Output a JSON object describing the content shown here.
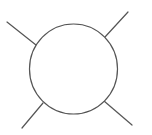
{
  "diagram": {
    "width": 152,
    "height": 135,
    "background": "#ffffff",
    "stroke_color": "#555555",
    "stroke_width": 1.2,
    "circle": {
      "cx": 73.5,
      "cy": 69,
      "rx": 44,
      "ry": 45,
      "fill": "#ffffff"
    },
    "lines": [
      {
        "name": "top-left-line",
        "x1": 7,
        "y1": 22,
        "x2": 36,
        "y2": 45
      },
      {
        "name": "top-right-line",
        "x1": 105,
        "y1": 37,
        "x2": 128,
        "y2": 12
      },
      {
        "name": "bottom-left-line",
        "x1": 43,
        "y1": 103,
        "x2": 22,
        "y2": 128
      },
      {
        "name": "bottom-right-line",
        "x1": 104,
        "y1": 101,
        "x2": 132,
        "y2": 125
      }
    ]
  }
}
